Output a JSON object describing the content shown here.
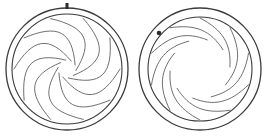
{
  "figure": {
    "background_color": "#ffffff",
    "width": 267,
    "height": 138,
    "stroke_color_ring": "#3a3a3f",
    "stroke_color_blade": "#55555c",
    "marker_color": "#2b2b30"
  },
  "diagrams": [
    {
      "id": "left",
      "label": "iris-closed",
      "state": "closed",
      "center_x": 67,
      "center_y": 69,
      "outer_ring_radius": 61,
      "inner_ring_radius": 55,
      "outer_ring_stroke_width": 1.3,
      "inner_ring_stroke_width": 1.1,
      "blade_count": 10,
      "blade_outer_radius": 53,
      "blade_aperture_radius": 9,
      "blade_stroke_width": 0.85,
      "blade_sweep_degrees": 118,
      "blade_bulge": 0.46,
      "rotation_offset_degrees": 0,
      "marker": {
        "name": "alignment-pin",
        "shape": "rect",
        "angle_degrees": -90,
        "x": 65.5,
        "y": 3.0,
        "width": 3.0,
        "height": 6.0
      }
    },
    {
      "id": "right",
      "label": "iris-open",
      "state": "open",
      "center_x": 200,
      "center_y": 69,
      "outer_ring_radius": 61,
      "inner_ring_radius": 52,
      "outer_ring_stroke_width": 1.3,
      "inner_ring_stroke_width": 1.1,
      "blade_count": 10,
      "blade_outer_radius": 51,
      "blade_aperture_radius": 30,
      "blade_stroke_width": 0.85,
      "blade_sweep_degrees": 86,
      "blade_bulge": 0.3,
      "rotation_offset_degrees": 18,
      "marker": {
        "name": "alignment-dot",
        "shape": "circle",
        "angle_degrees": -147,
        "x": 159.0,
        "y": 33.0,
        "radius": 2.3
      }
    }
  ]
}
